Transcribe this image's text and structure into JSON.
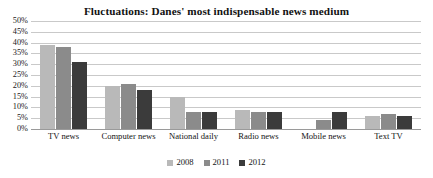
{
  "chart_data": {
    "type": "bar",
    "title": "Fluctuations: Danes' most indispensable news medium",
    "xlabel": "",
    "ylabel": "",
    "ylim": [
      0,
      50
    ],
    "ytick_suffix": "%",
    "yticks": [
      0,
      5,
      10,
      15,
      20,
      25,
      30,
      35,
      40,
      45,
      50
    ],
    "ytick_labels": [
      "0%",
      "5%",
      "10%",
      "15%",
      "20%",
      "25%",
      "30%",
      "35%",
      "40%",
      "45%",
      "50%"
    ],
    "grid": true,
    "legend_position": "bottom",
    "categories": [
      "TV news",
      "Computer news",
      "National daily",
      "Radio news",
      "Mobile news",
      "Text TV"
    ],
    "series": [
      {
        "name": "2008",
        "color": "#b9b9b9",
        "values": [
          39,
          20,
          15,
          9,
          0,
          6
        ]
      },
      {
        "name": "2011",
        "color": "#8b8b8b",
        "values": [
          38,
          21,
          8,
          8,
          4,
          7
        ]
      },
      {
        "name": "2012",
        "color": "#3b3b3b",
        "values": [
          31,
          18,
          8,
          8,
          8,
          6
        ]
      }
    ]
  },
  "colors": {
    "gridline": "#c9c9c9",
    "baseline": "#9a9a9a",
    "text": "#141414",
    "background": "#ffffff"
  }
}
